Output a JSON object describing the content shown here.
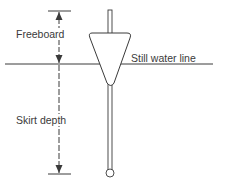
{
  "diagram": {
    "type": "float-barrier-schematic",
    "labels": {
      "freeboard": "Freeboard",
      "still_water_line": "Still water line",
      "skirt_depth": "Skirt depth"
    },
    "colors": {
      "line": "#3a3a3a",
      "background": "#ffffff"
    }
  }
}
